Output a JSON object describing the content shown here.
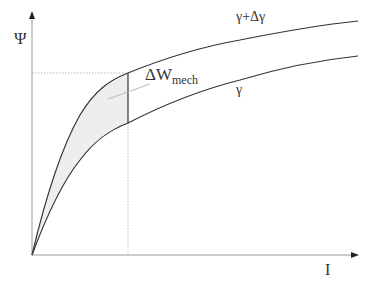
{
  "diagram": {
    "y_axis_label": "Ψ",
    "x_axis_label": "I",
    "curves": [
      {
        "name": "upper",
        "label": "γ+Δγ"
      },
      {
        "name": "lower",
        "label": "γ"
      }
    ],
    "area_label": {
      "main": "ΔW",
      "subscript": "mech"
    },
    "colors": {
      "curve": "#333333",
      "axis": "#999999",
      "dotted_guide": "#aaaaaa",
      "shaded_area": "#eeeeee"
    }
  }
}
